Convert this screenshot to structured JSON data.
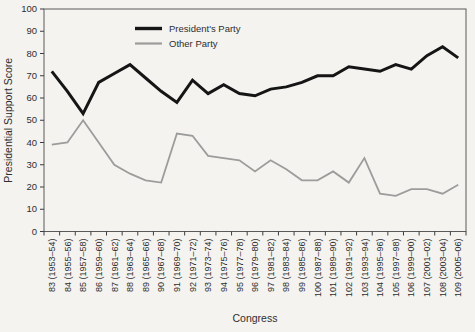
{
  "figure": {
    "kind": "scanned textbook line chart",
    "background_color": "#f4f3f0",
    "frame_color": "#5a5a5a",
    "tick_color": "#3c3c3c",
    "text_color": "#2e2e2e"
  },
  "chart_data": {
    "type": "line",
    "title": "",
    "xlabel": "Congress",
    "ylabel": "Presidential Support Score",
    "ylim": [
      0,
      100
    ],
    "ytick_step": 10,
    "grid": false,
    "legend_position": "top-center-inside",
    "categories": [
      "83 (1953–54)",
      "84 (1955–56)",
      "85 (1957–58)",
      "86 (1959–60)",
      "87 (1961–62)",
      "88 (1963–64)",
      "89 (1965–66)",
      "90 (1967–68)",
      "91 (1969–70)",
      "92 (1971–72)",
      "93 (1973–74)",
      "94 (1975–76)",
      "95 (1977–78)",
      "96 (1979–80)",
      "97 (1981–82)",
      "98 (1983–84)",
      "99 (1985–86)",
      "100 (1987–88)",
      "101 (1989–90)",
      "102 (1991–92)",
      "103 (1993–94)",
      "104 (1995–96)",
      "105 (1997–98)",
      "106 (1999–00)",
      "107 (2001–02)",
      "108 (2003–04)",
      "109 (2005–06)"
    ],
    "series": [
      {
        "name": "President's Party",
        "color": "#151515",
        "stroke_width": 3,
        "values": [
          72,
          63,
          53,
          67,
          71,
          75,
          69,
          63,
          58,
          68,
          62,
          66,
          62,
          61,
          64,
          65,
          67,
          70,
          70,
          74,
          73,
          72,
          75,
          73,
          79,
          83,
          78
        ]
      },
      {
        "name": "Other Party",
        "color": "#9c9c9c",
        "stroke_width": 1.8,
        "values": [
          39,
          40,
          50,
          40,
          30,
          26,
          23,
          22,
          44,
          43,
          34,
          33,
          32,
          27,
          32,
          28,
          23,
          23,
          27,
          22,
          33,
          17,
          16,
          19,
          19,
          17,
          21
        ]
      }
    ]
  }
}
